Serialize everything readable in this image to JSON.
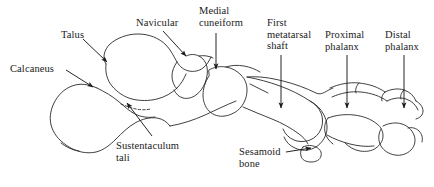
{
  "figure": {
    "background_color": "#ffffff",
    "line_color": "#1a1a1a",
    "text_color": "#1a1a1a",
    "width": 434,
    "height": 187
  },
  "labels": [
    {
      "id": "calcaneus",
      "text": "Calcaneus",
      "x": 10,
      "y": 63,
      "align": "left"
    },
    {
      "id": "talus",
      "text": "Talus",
      "x": 61,
      "y": 29,
      "align": "left"
    },
    {
      "id": "navicular",
      "text": "Navicular",
      "x": 136,
      "y": 17,
      "align": "left"
    },
    {
      "id": "medial-cuneiform",
      "text": "Medial\ncuneiform",
      "x": 199,
      "y": 5,
      "align": "left"
    },
    {
      "id": "first-metatarsal",
      "text": "First\nmetatarsal\nshaft",
      "x": 267,
      "y": 17,
      "align": "left"
    },
    {
      "id": "proximal-phalanx",
      "text": "Proximal\nphalanx",
      "x": 325,
      "y": 29,
      "align": "left"
    },
    {
      "id": "distal-phalanx",
      "text": "Distal\nphalanx",
      "x": 385,
      "y": 29,
      "align": "left"
    },
    {
      "id": "sustentaculum-tali",
      "text": "Sustentaculum\ntali",
      "x": 116,
      "y": 140,
      "align": "left"
    },
    {
      "id": "sesamoid-bone",
      "text": "Sesamoid\nbone",
      "x": 239,
      "y": 146,
      "align": "left"
    }
  ],
  "leaders": [
    {
      "id": "leader-calcaneus",
      "from": [
        66,
        70
      ],
      "to": [
        93,
        87
      ]
    },
    {
      "id": "leader-talus",
      "from": [
        83,
        39
      ],
      "to": [
        107,
        62
      ]
    },
    {
      "id": "leader-navicular",
      "from": [
        163,
        31
      ],
      "to": [
        186,
        56
      ]
    },
    {
      "id": "leader-medial-cuneiform",
      "from": [
        216,
        33
      ],
      "to": [
        216,
        69
      ]
    },
    {
      "id": "leader-first-metatarsal",
      "from": [
        281,
        55
      ],
      "to": [
        281,
        108
      ]
    },
    {
      "id": "leader-proximal-phalanx",
      "from": [
        347,
        55
      ],
      "to": [
        347,
        108
      ]
    },
    {
      "id": "leader-distal-phalanx",
      "from": [
        404,
        55
      ],
      "to": [
        404,
        108
      ]
    },
    {
      "id": "leader-sustentaculum-tali",
      "from": [
        152,
        136
      ],
      "to": [
        127,
        103
      ]
    },
    {
      "id": "leader-sesamoid-bone",
      "from": [
        286,
        152
      ],
      "to": [
        311,
        148
      ]
    }
  ],
  "bones": [
    {
      "id": "calcaneus-bone",
      "name": "Calcaneus"
    },
    {
      "id": "talus-bone",
      "name": "Talus"
    },
    {
      "id": "navicular-bone",
      "name": "Navicular"
    },
    {
      "id": "cuneiform-bone",
      "name": "Medial cuneiform"
    },
    {
      "id": "metatarsal-bone",
      "name": "First metatarsal"
    },
    {
      "id": "proximal-phalanx-bone",
      "name": "Proximal phalanx"
    },
    {
      "id": "distal-phalanx-bone",
      "name": "Distal phalanx"
    },
    {
      "id": "sesamoid-bone-shape",
      "name": "Sesamoid bone"
    },
    {
      "id": "lesser-toes",
      "name": "Lesser toe bones"
    }
  ]
}
